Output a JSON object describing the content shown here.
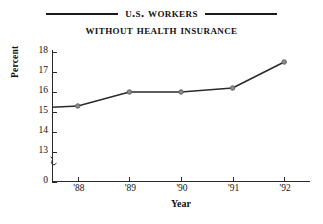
{
  "chart_data": {
    "type": "line",
    "title": "U.S. Workers",
    "title_line2": "Without Health Insurance",
    "xlabel": "Year",
    "ylabel": "Percent",
    "categories": [
      "'88",
      "'89",
      "'90",
      "'91",
      "'92"
    ],
    "x": [
      1988,
      1989,
      1990,
      1991,
      1992
    ],
    "values": [
      15.3,
      16.0,
      16.0,
      16.2,
      17.5
    ],
    "series": [
      {
        "name": "Percent of U.S. workers without health insurance",
        "values": [
          15.3,
          16.0,
          16.0,
          16.2,
          17.5
        ]
      }
    ],
    "ylim": [
      13,
      18
    ],
    "ytick_labels": [
      "18",
      "17",
      "16",
      "15",
      "14",
      "13",
      "0"
    ],
    "ytick_values": [
      18,
      17,
      16,
      15,
      14,
      13,
      0
    ],
    "y_axis_break": true,
    "y_axis_break_between": [
      13,
      0
    ],
    "xtick_labels": [
      "'88",
      "'89",
      "'90",
      "'91",
      "'92"
    ],
    "grid": false,
    "legend": false,
    "legend_position": "none",
    "line_color": "#2b2b2b",
    "marker_color": "#8a8a8a",
    "marker_edge_color": "#5a5a5a",
    "marker_shape": "circle",
    "background_color": "#ffffff",
    "axis_color": "#2a2a2a",
    "text_color": "#111111"
  },
  "figure": {
    "title_rule_color": "#1b1b1b",
    "has_title_rules": true
  }
}
